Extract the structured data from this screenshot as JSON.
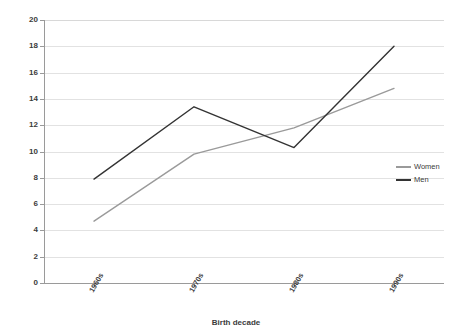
{
  "chart_data": {
    "type": "line",
    "title": "",
    "subtitle": "",
    "xlabel": "Birth decade",
    "ylabel": "",
    "categories": [
      "1960s",
      "1970s",
      "1980s",
      "1990s"
    ],
    "series": [
      {
        "name": "Women",
        "values": [
          4.7,
          9.8,
          11.8,
          14.8
        ],
        "color": "#9a9a9a"
      },
      {
        "name": "Men",
        "values": [
          7.9,
          13.4,
          10.3,
          18.0
        ],
        "color": "#333333"
      }
    ],
    "ylim": [
      0,
      20
    ],
    "ytick_step": 2,
    "yticks": [
      0,
      2,
      4,
      6,
      8,
      10,
      12,
      14,
      16,
      18,
      20
    ],
    "ytick_labels": [
      "0",
      "2",
      "4",
      "6",
      "8",
      "10",
      "12",
      "14",
      "16",
      "18",
      "20"
    ],
    "grid": true,
    "grid_axis": "y",
    "legend_position": "right",
    "xtick_label_rotation": -60
  },
  "legend": {
    "entries": [
      {
        "label": "Women",
        "color": "#9a9a9a"
      },
      {
        "label": "Men",
        "color": "#333333"
      }
    ]
  },
  "axes": {
    "x_title": "Birth decade"
  }
}
